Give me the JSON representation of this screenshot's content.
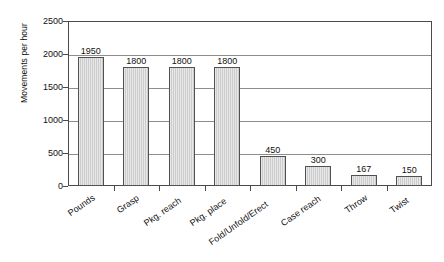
{
  "chart_data": {
    "type": "bar",
    "title": "",
    "xlabel": "",
    "ylabel": "Movements per hour",
    "ylim": [
      0,
      2500
    ],
    "ytick_step": 500,
    "grid": true,
    "legend": "none",
    "label_rotation_deg": -35,
    "categories": [
      "Pounds",
      "Grasp",
      "Pkg. reach",
      "Pkg. place",
      "Fold/Unfold/Erect",
      "Case reach",
      "Throw",
      "Twist"
    ],
    "values": [
      1950,
      1800,
      1800,
      1800,
      450,
      300,
      167,
      150
    ],
    "value_labels": [
      "1950",
      "1800",
      "1800",
      "1800",
      "450",
      "300",
      "167",
      "150"
    ],
    "yticks": [
      0,
      500,
      1000,
      1500,
      2000,
      2500
    ],
    "ytick_labels": [
      "0",
      "500",
      "1000",
      "1500",
      "2000",
      "2500"
    ],
    "colors": {
      "bar_fill": "#cccccc",
      "bar_border": "#515151",
      "gridline": "#8d8d8d",
      "axis": "#4a4a4a",
      "text": "#111111",
      "background": "#ffffff"
    }
  }
}
